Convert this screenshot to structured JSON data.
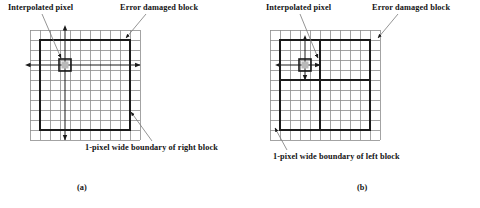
{
  "figure": {
    "background_color": "#ffffff",
    "ink_color": "#131313",
    "grid_line_color": "#8c8c8c",
    "bold_line_color": "#1a1a1a",
    "leader_line_color": "#7a7a7a",
    "interpolated_fill_color": "#b9b9b9",
    "panels": [
      {
        "id": "a",
        "subcaption": "(a)",
        "labels": {
          "interpolated_pixel": "Interpolated pixel",
          "error_damaged_block": "Error damaged block",
          "boundary": "1-pixel wide boundary of right block"
        },
        "grid": {
          "cols": 11,
          "rows": 11,
          "cell_size": 10,
          "origin_x": 30,
          "origin_y": 30
        },
        "bold_block": {
          "col_start": 1,
          "row_start": 1,
          "col_end": 10,
          "row_end": 10
        },
        "interpolated_pixel": {
          "col": 3,
          "row": 3
        },
        "arrows": {
          "horizontal": {
            "from_col": 0,
            "to_col": 11,
            "row": 3
          },
          "vertical": {
            "from_row": 0,
            "to_row": 11,
            "col": 3
          }
        },
        "internal_bold_lines": []
      },
      {
        "id": "b",
        "subcaption": "(b)",
        "labels": {
          "interpolated_pixel": "Interpolated pixel",
          "error_damaged_block": "Error damaged block",
          "boundary": "1-pixel wide boundary of left block"
        },
        "grid": {
          "cols": 11,
          "rows": 11,
          "cell_size": 10,
          "origin_x": 30,
          "origin_y": 30
        },
        "bold_block": {
          "col_start": 1,
          "row_start": 1,
          "col_end": 10,
          "row_end": 10
        },
        "interpolated_pixel": {
          "col": 3,
          "row": 3
        },
        "arrows": {
          "horizontal": {
            "from_col": 1,
            "to_col": 5,
            "row": 3
          },
          "vertical": {
            "from_row": 1,
            "to_row": 5,
            "col": 3
          }
        },
        "internal_bold_lines": [
          {
            "orientation": "vertical",
            "at": 5,
            "from": 1,
            "to": 10
          },
          {
            "orientation": "horizontal",
            "at": 5,
            "from": 1,
            "to": 10
          }
        ]
      }
    ]
  }
}
